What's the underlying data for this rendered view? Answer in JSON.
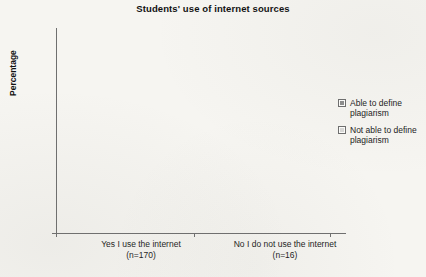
{
  "chart_data": {
    "type": "bar",
    "title": "Students' use of internet sources",
    "xlabel": "",
    "ylabel": "Percentage",
    "ylim": [
      0,
      60
    ],
    "yticks": [
      0,
      10,
      20,
      30,
      40,
      50,
      60
    ],
    "grid": true,
    "legend_position": "right",
    "categories": [
      "Yes I use the internet",
      "No I do not use the internet"
    ],
    "category_sublabels": [
      "(n=170)",
      "(n=16)"
    ],
    "series": [
      {
        "name": "Able to define plagiarism",
        "color": "#8d8d8d",
        "values": [
          48,
          52
        ],
        "labels": [
          "48%",
          "52%"
        ]
      },
      {
        "name": "Not able to define plagiarism",
        "color": "#d9d9d7",
        "values": [
          43,
          57
        ],
        "labels": [
          "43%",
          "57%"
        ]
      }
    ],
    "note": "Series 1 is the dark bar of each pair; series 2 is the light bar of each pair."
  },
  "legend": {
    "items": [
      {
        "label": "Able to define plagiarism",
        "swatch": "#8d8d8d"
      },
      {
        "label": "Not able to define plagiarism",
        "swatch": "#d9d9d7"
      }
    ]
  },
  "bars": [
    {
      "value_label": "48%",
      "group": "Yes I use the internet",
      "series": "Able to define plagiarism"
    },
    {
      "value_label": "52%",
      "group": "Yes I use the internet",
      "series": "Not able to define plagiarism"
    },
    {
      "value_label": "43%",
      "group": "No I do not use the internet",
      "series": "Able to define plagiarism"
    },
    {
      "value_label": "57%",
      "group": "No I do not use the internet",
      "series": "Not able to define plagiarism"
    }
  ],
  "yticklabels": [
    "0",
    "10",
    "20",
    "30",
    "40",
    "50",
    "60"
  ]
}
